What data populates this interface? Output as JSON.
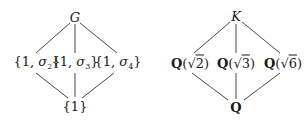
{
  "left_diagram": {
    "top": {
      "label": "G"
    },
    "middle": [
      {
        "prefix": "{1, ",
        "sym": "σ",
        "sub": "2",
        "suffix": "}"
      },
      {
        "prefix": "{1, ",
        "sym": "σ",
        "sub": "3",
        "suffix": "}"
      },
      {
        "prefix": "{1, ",
        "sym": "σ",
        "sub": "4",
        "suffix": "}"
      }
    ],
    "bottom": {
      "label": "{1}"
    }
  },
  "right_diagram": {
    "top": {
      "label": "K"
    },
    "middle": [
      {
        "field": "Q",
        "open": "(√",
        "radicand": "2",
        "close": ")"
      },
      {
        "field": "Q",
        "open": "(√",
        "radicand": "3",
        "close": ")"
      },
      {
        "field": "Q",
        "open": "(√",
        "radicand": "6",
        "close": ")"
      }
    ],
    "bottom": {
      "label": "Q"
    }
  }
}
